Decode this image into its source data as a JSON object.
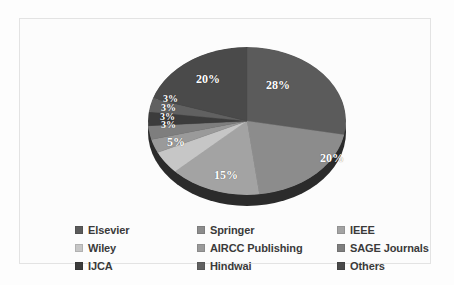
{
  "chart_data": {
    "type": "pie",
    "title": "",
    "subtitle": "",
    "xlabel": "",
    "ylabel": "",
    "legend_position": "bottom",
    "grid": false,
    "units": "percent",
    "categories": [
      "Elsevier",
      "Springer",
      "IEEE",
      "Wiley",
      "AIRCC Publishing",
      "SAGE Journals",
      "IJCA",
      "Hindwai",
      "Others"
    ],
    "values": [
      28,
      20,
      15,
      5,
      3,
      3,
      3,
      3,
      20
    ],
    "labels": [
      "28%",
      "20%",
      "15%",
      "5%",
      "3%",
      "3%",
      "3%",
      "3%",
      "20%"
    ],
    "colors": [
      "#5b5b5b",
      "#8c8c8c",
      "#a3a3a3",
      "#c6c6c6",
      "#9a9a9a",
      "#7e7e7e",
      "#3c3c3c",
      "#616161",
      "#4a4a4a"
    ],
    "slices": [
      {
        "label": "Elsevier",
        "value": 28,
        "display": "28%",
        "color": "#5b5b5b"
      },
      {
        "label": "Springer",
        "value": 20,
        "display": "20%",
        "color": "#8c8c8c"
      },
      {
        "label": "IEEE",
        "value": 15,
        "display": "15%",
        "color": "#a3a3a3"
      },
      {
        "label": "Wiley",
        "value": 5,
        "display": "5%",
        "color": "#c6c6c6"
      },
      {
        "label": "AIRCC Publishing",
        "value": 3,
        "display": "3%",
        "color": "#9a9a9a"
      },
      {
        "label": "SAGE Journals",
        "value": 3,
        "display": "3%",
        "color": "#7e7e7e"
      },
      {
        "label": "IJCA",
        "value": 3,
        "display": "3%",
        "color": "#3c3c3c"
      },
      {
        "label": "Hindwai",
        "value": 3,
        "display": "3%",
        "color": "#616161"
      },
      {
        "label": "Others",
        "value": 20,
        "display": "20%",
        "color": "#4a4a4a"
      }
    ]
  },
  "pie_labels": [
    {
      "text": "28%",
      "x": 118,
      "y": 35,
      "size": "big"
    },
    {
      "text": "20%",
      "x": 172,
      "y": 108,
      "size": "big"
    },
    {
      "text": "15%",
      "x": 66,
      "y": 125,
      "size": "big"
    },
    {
      "text": "5%",
      "x": 19,
      "y": 92,
      "size": "big"
    },
    {
      "text": "3%",
      "x": 13,
      "y": 76,
      "size": "small"
    },
    {
      "text": "3%",
      "x": 12,
      "y": 68,
      "size": "small"
    },
    {
      "text": "3%",
      "x": 13,
      "y": 59,
      "size": "small"
    },
    {
      "text": "3%",
      "x": 15,
      "y": 50,
      "size": "small"
    },
    {
      "text": "20%",
      "x": 48,
      "y": 29,
      "size": "big"
    }
  ],
  "legend": {
    "order": [
      "Elsevier",
      "Springer",
      "IEEE",
      "Wiley",
      "AIRCC Publishing",
      "SAGE Journals",
      "IJCA",
      "Hindwai",
      "Others"
    ],
    "items": [
      {
        "label": "Elsevier",
        "color": "#5b5b5b"
      },
      {
        "label": "Springer",
        "color": "#8c8c8c"
      },
      {
        "label": "IEEE",
        "color": "#a3a3a3"
      },
      {
        "label": "Wiley",
        "color": "#c6c6c6"
      },
      {
        "label": "AIRCC Publishing",
        "color": "#9a9a9a"
      },
      {
        "label": "SAGE Journals",
        "color": "#7e7e7e"
      },
      {
        "label": "IJCA",
        "color": "#3c3c3c"
      },
      {
        "label": "Hindwai",
        "color": "#616161"
      },
      {
        "label": "Others",
        "color": "#4a4a4a"
      }
    ]
  },
  "theme": {
    "background": "#fdfdfd",
    "frame_border": "#e3e3e3",
    "label_text": "#ffffff",
    "legend_text": "#3a3a3a",
    "pie_depth": "#2b2b2b"
  }
}
